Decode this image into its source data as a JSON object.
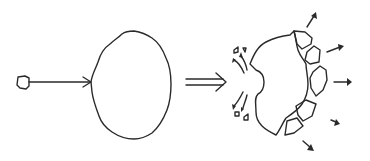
{
  "diagram": {
    "description": "Impact fragmentation sketch: projectile strikes body, which then breaks apart",
    "stages": [
      {
        "id": "before",
        "label": "Projectile approaching target body"
      },
      {
        "id": "after",
        "label": "Target body fragmented with ejecta"
      }
    ],
    "elements": {
      "projectile": "small irregular projectile",
      "trajectory": "arrow toward target",
      "target": "large irregular body",
      "transition": "double-line implication arrow",
      "crater": "impact crater with ejecta",
      "fragments_count": 5,
      "outward_arrows_count": 5
    },
    "colors": {
      "line": "#2a2a2a",
      "background": "#ffffff"
    }
  }
}
